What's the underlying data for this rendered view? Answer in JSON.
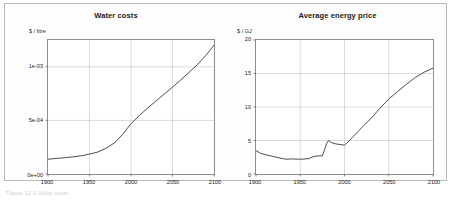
{
  "figure": {
    "caption": "Figure 12.3  Utility costs",
    "panel_letters": {
      "left": "a",
      "right": "b"
    }
  },
  "chart_data": [
    {
      "type": "line",
      "title": "Water costs",
      "panel_label": "a",
      "xlabel": "",
      "ylabel": "$ / litre",
      "xlim": [
        1900,
        2100
      ],
      "ylim": [
        0,
        0.00125
      ],
      "xticks": [
        1900,
        1950,
        2000,
        2050,
        2100
      ],
      "xtick_labels": [
        "1900",
        "1950",
        "2000",
        "2050",
        "2100"
      ],
      "yticks": [
        0,
        0.0005,
        0.001
      ],
      "ytick_labels": [
        "0e+00",
        "5e-04",
        "1e-03"
      ],
      "grid": true,
      "legend": "none",
      "series": [
        {
          "name": "Water cost",
          "x": [
            1900,
            1910,
            1920,
            1930,
            1940,
            1950,
            1960,
            1970,
            1980,
            1990,
            2000,
            2010,
            2020,
            2030,
            2040,
            2050,
            2060,
            2070,
            2080,
            2090,
            2100
          ],
          "values": [
            0.000138,
            0.000145,
            0.000152,
            0.00016,
            0.00017,
            0.000185,
            0.000205,
            0.00024,
            0.00029,
            0.00037,
            0.00047,
            0.000545,
            0.000615,
            0.00068,
            0.000745,
            0.00081,
            0.000878,
            0.000948,
            0.00102,
            0.001105,
            0.0012
          ]
        }
      ]
    },
    {
      "type": "line",
      "title": "Average energy price",
      "panel_label": "b",
      "xlabel": "",
      "ylabel": "$ / GJ",
      "xlim": [
        1900,
        2100
      ],
      "ylim": [
        0,
        20
      ],
      "xticks": [
        1900,
        1950,
        2000,
        2050,
        2100
      ],
      "xtick_labels": [
        "1900",
        "1950",
        "2000",
        "2050",
        "2100"
      ],
      "yticks": [
        0,
        5,
        10,
        15,
        20
      ],
      "ytick_labels": [
        "0",
        "5",
        "10",
        "15",
        "20"
      ],
      "grid": true,
      "legend": "none",
      "series": [
        {
          "name": "Average energy price",
          "x": [
            1900,
            1905,
            1910,
            1920,
            1930,
            1935,
            1940,
            1950,
            1960,
            1965,
            1970,
            1975,
            1980,
            1982,
            1985,
            1990,
            1995,
            2000,
            2005,
            2010,
            2020,
            2030,
            2040,
            2050,
            2060,
            2070,
            2080,
            2090,
            2100
          ],
          "values": [
            3.5,
            3.1,
            2.9,
            2.6,
            2.3,
            2.2,
            2.25,
            2.2,
            2.3,
            2.6,
            2.7,
            2.7,
            4.6,
            5.0,
            4.7,
            4.5,
            4.4,
            4.3,
            4.9,
            5.6,
            7.0,
            8.3,
            9.8,
            11.2,
            12.3,
            13.4,
            14.4,
            15.2,
            15.8
          ]
        }
      ]
    }
  ]
}
